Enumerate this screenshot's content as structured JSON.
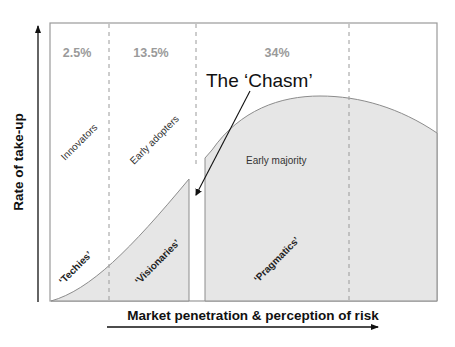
{
  "diagram": {
    "x_axis_label": "Market penetration & perception of risk",
    "y_axis_label": "Rate of take-up",
    "chasm_label": "The ‘Chasm’",
    "segments": [
      {
        "percent": "2.5%",
        "name": "Innovators",
        "tag": "‘Techies’"
      },
      {
        "percent": "13.5%",
        "name": "Early adopters",
        "tag": "‘Visionaries’"
      },
      {
        "percent": "34%",
        "name": "Early majority",
        "tag": "‘Pragmatics’"
      }
    ],
    "colors": {
      "fill": "#e6e6e6",
      "curve": "#8c8c8c",
      "frame": "#9a9a9a",
      "divider": "#9a9a9a",
      "percent_text": "#9a9a9a",
      "axis": "#111111"
    }
  }
}
